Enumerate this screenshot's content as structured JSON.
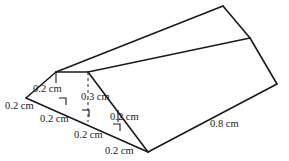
{
  "figure": {
    "units": "cm",
    "stroke_color": "#1a1a1a",
    "background_color": "#ffffff",
    "dimensions": [
      {
        "id": "slant-left-upper",
        "text": "0.2 cm",
        "x": 33,
        "y": 84
      },
      {
        "id": "height-center",
        "text": "0.3 cm",
        "x": 81,
        "y": 92
      },
      {
        "id": "slant-left-lower",
        "text": "0.2 cm",
        "x": 5,
        "y": 101
      },
      {
        "id": "base-segment-1",
        "text": "0.2 cm",
        "x": 40,
        "y": 114
      },
      {
        "id": "base-segment-2",
        "text": "0.2 cm",
        "x": 110,
        "y": 112
      },
      {
        "id": "base-segment-3",
        "text": "0.2 cm",
        "x": 74,
        "y": 130
      },
      {
        "id": "base-segment-4",
        "text": "0.2 cm",
        "x": 105,
        "y": 146
      },
      {
        "id": "depth-right",
        "text": "0.8 cm",
        "x": 210,
        "y": 119
      }
    ]
  }
}
